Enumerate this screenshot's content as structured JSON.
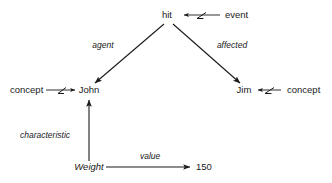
{
  "diagram": {
    "type": "semantic-network",
    "title": "",
    "nodes": [
      {
        "id": "hit",
        "label": "hit",
        "style": "upright",
        "x": 167,
        "y": 18
      },
      {
        "id": "event",
        "label": "event",
        "style": "upright",
        "x": 232,
        "y": 18
      },
      {
        "id": "john",
        "label": "John",
        "style": "upright",
        "x": 89,
        "y": 93
      },
      {
        "id": "concept_l",
        "label": "concept",
        "style": "upright",
        "x": 24,
        "y": 93
      },
      {
        "id": "jim",
        "label": "Jim",
        "style": "upright",
        "x": 244,
        "y": 93
      },
      {
        "id": "concept_r",
        "label": "concept",
        "style": "upright",
        "x": 289,
        "y": 93
      },
      {
        "id": "weight",
        "label": "Weight",
        "style": "italic",
        "x": 89,
        "y": 170
      },
      {
        "id": "value150",
        "label": "150",
        "style": "upright",
        "x": 199,
        "y": 170
      }
    ],
    "edges": [
      {
        "id": "agent",
        "label": "agent",
        "from": "hit",
        "to": "john",
        "kind": "arrow"
      },
      {
        "id": "affected",
        "label": "affected",
        "from": "hit",
        "to": "jim",
        "kind": "arrow"
      },
      {
        "id": "isa_event",
        "label": "",
        "from": "event",
        "to": "hit",
        "kind": "isa-arrow"
      },
      {
        "id": "isa_john",
        "label": "",
        "from": "concept_l",
        "to": "john",
        "kind": "isa-arrow"
      },
      {
        "id": "isa_jim",
        "label": "",
        "from": "concept_r",
        "to": "jim",
        "kind": "isa-arrow"
      },
      {
        "id": "characteristic",
        "label": "characteristic",
        "from": "weight",
        "to": "john",
        "kind": "arrow"
      },
      {
        "id": "value",
        "label": "value",
        "from": "weight",
        "to": "value150",
        "kind": "arrow"
      }
    ],
    "colors": {
      "ink": "#1a1a1a",
      "background": "#ffffff"
    }
  }
}
